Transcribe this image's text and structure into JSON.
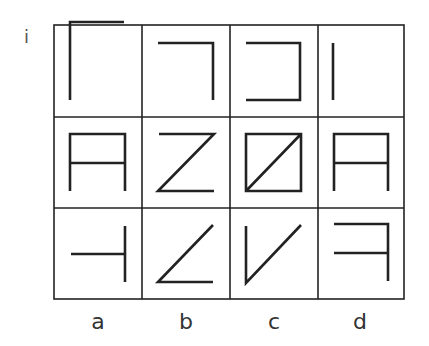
{
  "question_label": "i",
  "grid": {
    "rows": 3,
    "cols": 4,
    "line_color": "#222222",
    "cells": [
      [
        {
          "name": "corner-top-left"
        },
        {
          "name": "corner-top-right"
        },
        {
          "name": "bracket-right"
        },
        {
          "name": "vertical-bar"
        }
      ],
      [
        {
          "name": "a-shape"
        },
        {
          "name": "z-shape"
        },
        {
          "name": "square-diagonal"
        },
        {
          "name": "a-shape-alt"
        }
      ],
      [
        {
          "name": "t-rotated"
        },
        {
          "name": "angle-bottom-left"
        },
        {
          "name": "v-shape"
        },
        {
          "name": "reversed-f"
        }
      ]
    ]
  },
  "column_labels": [
    "a",
    "b",
    "c",
    "d"
  ]
}
